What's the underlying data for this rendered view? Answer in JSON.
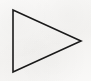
{
  "canvas": {
    "width": 91,
    "height": 81,
    "background_color": "#f6f5f3",
    "description": "Scanned page fragment showing a single outlined triangle"
  },
  "shape": {
    "name": "right-pointing-triangle",
    "icon_label": "play-triangle-icon",
    "glyph": "▷",
    "fill": "none",
    "stroke_color": "#1a1a1a",
    "stroke_width": 1.6,
    "points": "13,10 13,72 81,41",
    "vertices": [
      {
        "label": "top-left",
        "x": 13,
        "y": 10
      },
      {
        "label": "bottom-left",
        "x": 13,
        "y": 72
      },
      {
        "label": "right-apex",
        "x": 81,
        "y": 41
      }
    ]
  }
}
